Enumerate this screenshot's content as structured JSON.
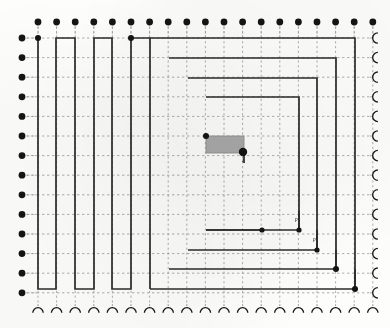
{
  "figure": {
    "type": "schematic",
    "width": 390,
    "height": 328,
    "background_color": "#fdfdfc",
    "wire_color": "#2b2b2b",
    "grid_color": "#9a9a9a",
    "terminal_color": "#141414",
    "block_fill": "#a9a9a9",
    "block_stroke": "#8f8f8f"
  },
  "grid": {
    "x_origin": 38,
    "y_origin": 38,
    "x_step": 18.6,
    "y_step": 19.6,
    "columns": 19,
    "rows": 14,
    "x_min": 22,
    "x_max": 372,
    "y_min": 22,
    "y_max": 306,
    "style": "dotted"
  },
  "terminals": {
    "top": {
      "name": "top-pin-row",
      "count": 19,
      "marker": "filled-dot",
      "y": 22,
      "radius": 3.4,
      "stub_length": 16
    },
    "left": {
      "name": "left-pin-column",
      "count": 14,
      "marker": "filled-dot",
      "x": 22,
      "radius": 3.4,
      "stub_length": 16
    },
    "right": {
      "name": "right-arc-column",
      "count": 14,
      "marker": "open-arc-left",
      "x": 375,
      "radius": 5.2,
      "stub_length": 11
    },
    "bottom": {
      "name": "bottom-arc-row",
      "count": 19,
      "marker": "open-arc-up",
      "y": 310,
      "radius": 5.2,
      "stub_length": 11
    }
  },
  "block": {
    "name": "macro-block",
    "x": 206,
    "y": 136,
    "width": 38,
    "height": 17,
    "fill": "#a9a9a9",
    "stroke": "#8f8f8f"
  },
  "nets": [
    {
      "name": "serpentine-net",
      "comment": "left comb / boustrophedon trace",
      "points": "38,38 38,289 56,289 56,38 75,38 75,289 94,289 94,38 112,38 112,289 131,289 131,38 150,38 150,289"
    },
    {
      "name": "ring-outer",
      "comment": "outermost concentric rectangle",
      "points": "150,38 355,38 355,289 150,289"
    },
    {
      "name": "ring-second",
      "points": "169,58 336,58 336,269 169,269"
    },
    {
      "name": "ring-third",
      "points": "188,78 317,78 317,250 188,250"
    },
    {
      "name": "ring-inner",
      "points": "206,97 299,97 299,230 206,230"
    },
    {
      "name": "block-stub-left",
      "points": "206,136 206,136"
    },
    {
      "name": "block-stub-right",
      "points": "244,153 244,163"
    },
    {
      "name": "inner-tail",
      "points": "206,230 262,230"
    },
    {
      "name": "right-drop-a",
      "points": "299,211 299,230"
    },
    {
      "name": "right-drop-b",
      "points": "317,230 317,250"
    },
    {
      "name": "right-drop-c",
      "points": "336,250 336,269"
    },
    {
      "name": "right-drop-d",
      "points": "355,269 355,289"
    }
  ],
  "junctions": [
    {
      "name": "junction-top-left",
      "x": 38,
      "y": 38,
      "radius": 3.0
    },
    {
      "name": "junction-top-mid",
      "x": 131,
      "y": 38,
      "radius": 3.0
    },
    {
      "name": "junction-block-nw",
      "x": 206,
      "y": 136,
      "radius": 3.0
    },
    {
      "name": "junction-block-se",
      "x": 243,
      "y": 152,
      "radius": 4.2
    },
    {
      "name": "junction-tail-end",
      "x": 262,
      "y": 230,
      "radius": 2.6
    },
    {
      "name": "junction-right-1",
      "x": 299,
      "y": 230,
      "radius": 2.6
    },
    {
      "name": "junction-right-2",
      "x": 317,
      "y": 250,
      "radius": 2.6
    },
    {
      "name": "junction-right-3",
      "x": 336,
      "y": 269,
      "radius": 3.0
    },
    {
      "name": "junction-right-4",
      "x": 355,
      "y": 289,
      "radius": 3.0
    }
  ],
  "pin_labels": [
    {
      "name": "pin-label-block",
      "text": "z",
      "x": 242,
      "y": 162
    },
    {
      "name": "pin-label-right1",
      "text": "p",
      "x": 295,
      "y": 221
    },
    {
      "name": "pin-label-right2",
      "text": "p'",
      "x": 313,
      "y": 241
    }
  ]
}
